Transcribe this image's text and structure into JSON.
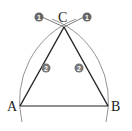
{
  "diagram": {
    "points": [
      {
        "label": "A",
        "x": 20,
        "y": 106
      },
      {
        "label": "B",
        "x": 108,
        "y": 106
      },
      {
        "label": "C",
        "x": 64,
        "y": 28
      }
    ],
    "step_markers": [
      {
        "label": "1",
        "x": 39,
        "y": 17
      },
      {
        "label": "1",
        "x": 87,
        "y": 17
      },
      {
        "label": "2",
        "x": 46,
        "y": 68
      },
      {
        "label": "2",
        "x": 79,
        "y": 68
      }
    ],
    "colors": {
      "line": "#222222",
      "arc": "#555555",
      "marker": "#666666"
    }
  }
}
